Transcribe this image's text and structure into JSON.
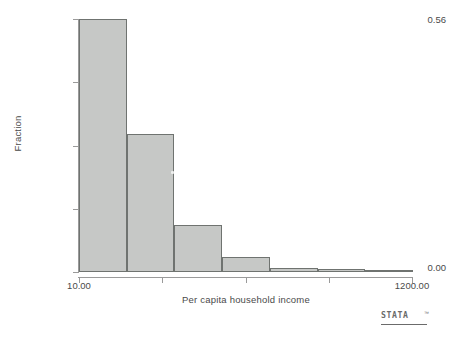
{
  "chart_data": {
    "type": "bar",
    "title": "",
    "xlabel": "Per capita household income",
    "ylabel": "Fraction",
    "categories": [
      "10.00-180.00",
      "180.00-350.00",
      "350.00-520.00",
      "520.00-690.00",
      "690.00-860.00",
      "860.00-1030.00",
      "1030.00-1200.00"
    ],
    "values": [
      0.56,
      0.305,
      0.105,
      0.033,
      0.008,
      0.006,
      0.005
    ],
    "xlim": [
      10.0,
      1200.0
    ],
    "ylim": [
      0.0,
      0.56
    ],
    "x_tick_labels": [
      "10.00",
      "",
      "",
      "",
      "1200.00"
    ],
    "x_tick_values": [
      10.0,
      307.5,
      605.0,
      902.5,
      1200.0
    ],
    "y_tick_labels": [
      "0.00",
      "",
      "",
      "",
      "0.56"
    ],
    "y_tick_values": [
      0.0,
      0.14,
      0.28,
      0.42,
      0.56
    ],
    "grid": false,
    "legend": null,
    "bar_fill_color": "#c6c8c6",
    "bar_edge_color": "#6f7370",
    "axis_color": "#9a9a9a",
    "text_color": "#4a4a4a",
    "background_color": "#ffffff",
    "bin_count": 7
  },
  "axis": {
    "y_title": "Fraction",
    "x_title": "Per capita household income",
    "y_labels": {
      "max": "0.56",
      "min": "0.00"
    },
    "x_labels": {
      "min": "10.00",
      "max": "1200.00"
    }
  },
  "branding": {
    "wordmark": "STATA",
    "trademark": "™"
  }
}
